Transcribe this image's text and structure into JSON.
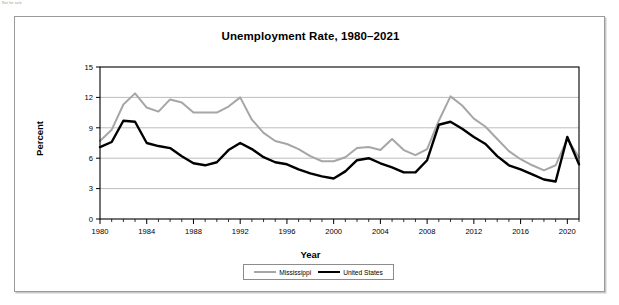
{
  "corner_note": "Not for sale",
  "figure": {
    "title": "Unemployment Rate, 1980–2021",
    "x_axis_title": "Year",
    "y_axis_title": "Percent"
  },
  "legend": {
    "items": [
      {
        "label": "Mississippi",
        "color": "#a6a6a6",
        "icon": "line-swatch-icon"
      },
      {
        "label": "United States",
        "color": "#000000",
        "icon": "line-swatch-icon"
      }
    ]
  },
  "chart_data": {
    "type": "line",
    "title": "Unemployment Rate, 1980–2021",
    "xlabel": "Year",
    "ylabel": "Percent",
    "xlim": [
      1980,
      2021
    ],
    "ylim": [
      0,
      15
    ],
    "yticks": [
      0,
      3,
      6,
      9,
      12,
      15
    ],
    "xticks": [
      1980,
      1984,
      1988,
      1992,
      1996,
      2000,
      2004,
      2008,
      2012,
      2016,
      2020
    ],
    "grid": "horizontal",
    "legend_position": "bottom-center",
    "x": [
      1980,
      1981,
      1982,
      1983,
      1984,
      1985,
      1986,
      1987,
      1988,
      1989,
      1990,
      1991,
      1992,
      1993,
      1994,
      1995,
      1996,
      1997,
      1998,
      1999,
      2000,
      2001,
      2002,
      2003,
      2004,
      2005,
      2006,
      2007,
      2008,
      2009,
      2010,
      2011,
      2012,
      2013,
      2014,
      2015,
      2016,
      2017,
      2018,
      2019,
      2020,
      2021
    ],
    "series": [
      {
        "name": "Mississippi",
        "color": "#a6a6a6",
        "values": [
          7.7,
          8.8,
          11.3,
          12.4,
          11.0,
          10.6,
          11.8,
          11.5,
          10.5,
          10.5,
          10.5,
          11.1,
          12.0,
          9.8,
          8.5,
          7.7,
          7.4,
          6.9,
          6.2,
          5.7,
          5.7,
          6.1,
          7.0,
          7.1,
          6.8,
          7.9,
          6.8,
          6.3,
          6.9,
          9.7,
          12.1,
          11.2,
          9.9,
          9.1,
          7.9,
          6.7,
          5.9,
          5.3,
          4.8,
          5.3,
          7.9,
          6.1
        ]
      },
      {
        "name": "United States",
        "color": "#000000",
        "values": [
          7.1,
          7.6,
          9.7,
          9.6,
          7.5,
          7.2,
          7.0,
          6.2,
          5.5,
          5.3,
          5.6,
          6.8,
          7.5,
          6.9,
          6.1,
          5.6,
          5.4,
          4.9,
          4.5,
          4.2,
          4.0,
          4.7,
          5.8,
          6.0,
          5.5,
          5.1,
          4.6,
          4.6,
          5.8,
          9.3,
          9.6,
          8.9,
          8.1,
          7.4,
          6.2,
          5.3,
          4.9,
          4.4,
          3.9,
          3.7,
          8.1,
          5.4
        ]
      }
    ]
  }
}
